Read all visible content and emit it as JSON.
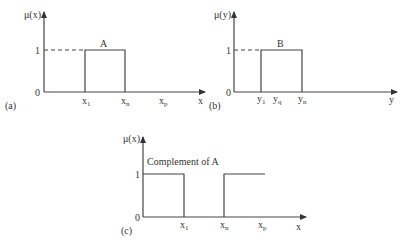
{
  "panels": {
    "a": {
      "label": "(a)",
      "y_axis_label": "μ(x)",
      "x_axis_label": "x",
      "y_tick_1": "1",
      "y_tick_0": "0",
      "set_label": "A",
      "x_ticks": [
        {
          "base": "x",
          "sub": "1"
        },
        {
          "base": "x",
          "sub": "n"
        },
        {
          "base": "x",
          "sub": "p"
        }
      ]
    },
    "b": {
      "label": "(b)",
      "y_axis_label": "μ(y)",
      "x_axis_label": "y",
      "y_tick_1": "1",
      "y_tick_0": "0",
      "set_label": "B",
      "x_ticks": [
        {
          "base": "y",
          "sub": "1"
        },
        {
          "base": "y",
          "sub": "q"
        },
        {
          "base": "y",
          "sub": "n"
        }
      ]
    },
    "c": {
      "label": "(c)",
      "y_axis_label": "μ(x)",
      "x_axis_label": "x",
      "y_tick_1": "1",
      "y_tick_0": "0",
      "set_label": "Complement of A",
      "x_ticks": [
        {
          "base": "x",
          "sub": "1"
        },
        {
          "base": "x",
          "sub": "n"
        },
        {
          "base": "x",
          "sub": "p"
        }
      ]
    }
  },
  "colors": {
    "line": "#444444",
    "text": "#333333",
    "background": "#ffffff"
  }
}
